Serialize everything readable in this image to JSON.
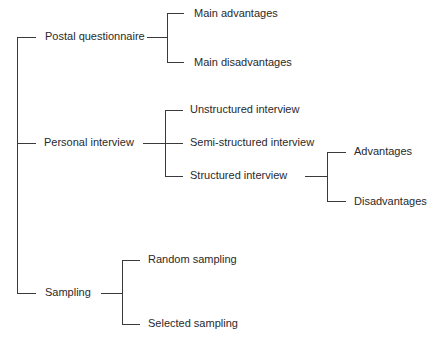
{
  "diagram": {
    "type": "tree",
    "root_branches": [
      {
        "label": "Postal questionnaire",
        "children": [
          {
            "label": "Main advantages"
          },
          {
            "label": "Main disadvantages"
          }
        ]
      },
      {
        "label": "Personal interview",
        "children": [
          {
            "label": "Unstructured interview"
          },
          {
            "label": "Semi-structured interview"
          },
          {
            "label": "Structured interview",
            "children": [
              {
                "label": "Advantages"
              },
              {
                "label": "Disadvantages"
              }
            ]
          }
        ]
      },
      {
        "label": "Sampling",
        "children": [
          {
            "label": "Random sampling"
          },
          {
            "label": "Selected sampling"
          }
        ]
      }
    ]
  },
  "labels": {
    "postal": "Postal questionnaire",
    "main_adv": "Main advantages",
    "main_disadv": "Main disadvantages",
    "personal": "Personal interview",
    "unstructured": "Unstructured interview",
    "semi": "Semi-structured interview",
    "structured": "Structured interview",
    "advantages": "Advantages",
    "disadvantages": "Disadvantages",
    "sampling": "Sampling",
    "random": "Random sampling",
    "selected": "Selected sampling"
  },
  "colors": {
    "line": "#3a3a3a",
    "text": "#2a2a2a",
    "background": "#ffffff"
  }
}
